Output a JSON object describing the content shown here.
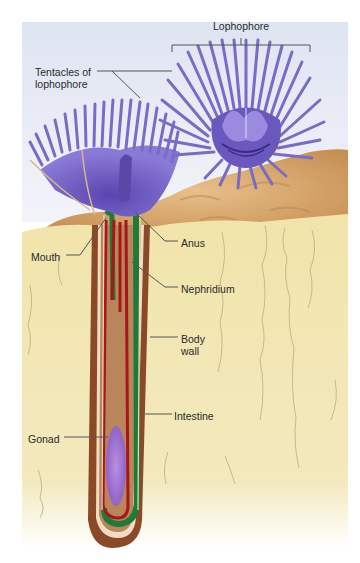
{
  "figure": {
    "colors": {
      "page_background": "#ffffff",
      "sky_top": "#dfe4f2",
      "sky_bottom": "#f6f6fb",
      "sediment": "#f1e5ad",
      "sediment_crack": "#c9b98a",
      "rock": "#d8a86a",
      "rock_dark": "#b98246",
      "lophophore": "#7b6bc6",
      "lophophore_dark": "#5a48a8",
      "tube_outer": "#8a4a2a",
      "tube_inner": "#b8865a",
      "body_wall": "#f0dcc0",
      "gut_red": "#a8161c",
      "intestine_green": "#1f7a3a",
      "gonad": "#9a6ad0",
      "leader_line": "#555555"
    }
  },
  "labels": [
    {
      "id": "lophophore",
      "text": "Lophophore",
      "x": 213,
      "y": 20
    },
    {
      "id": "tentacles",
      "text": "Tentacles of\nlophophore",
      "x": 35,
      "y": 66
    },
    {
      "id": "mouth",
      "text": "Mouth",
      "x": 31,
      "y": 251
    },
    {
      "id": "anus",
      "text": "Anus",
      "x": 181,
      "y": 237
    },
    {
      "id": "nephridium",
      "text": "Nephridium",
      "x": 181,
      "y": 283
    },
    {
      "id": "body_wall",
      "text": "Body\nwall",
      "x": 181,
      "y": 333
    },
    {
      "id": "intestine",
      "text": "Intestine",
      "x": 174,
      "y": 410
    },
    {
      "id": "gonad",
      "text": "Gonad",
      "x": 28,
      "y": 433
    }
  ]
}
